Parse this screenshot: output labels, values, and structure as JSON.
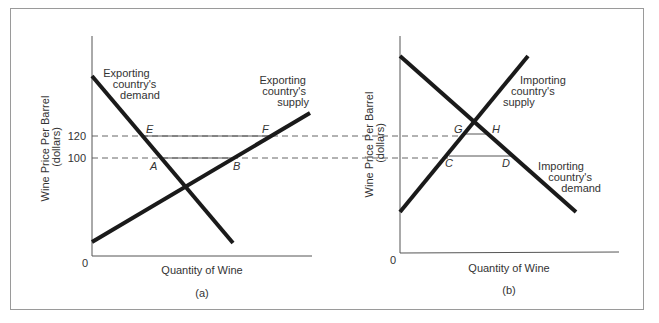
{
  "panels": [
    {
      "id": "a",
      "caption": "(a)",
      "y_axis_title_line1": "Wine Price Per Barrel",
      "y_axis_title_line2": "(dollars)",
      "x_axis_title": "Quantity of Wine",
      "origin_label": "0",
      "y_ticks": [
        "120",
        "100"
      ],
      "curves": {
        "demand": {
          "line1": "Exporting",
          "line2": "country's",
          "line3": "demand"
        },
        "supply": {
          "line1": "Exporting",
          "line2": "country's",
          "line3": "supply"
        }
      },
      "points": {
        "E": "E",
        "F": "F",
        "A": "A",
        "B": "B"
      }
    },
    {
      "id": "b",
      "caption": "(b)",
      "y_axis_title_line1": "Wine Price Per Barrel",
      "y_axis_title_line2": "(dollars)",
      "x_axis_title": "Quantity of Wine",
      "origin_label": "0",
      "curves": {
        "supply": {
          "line1": "Importing",
          "line2": "country's",
          "line3": "supply"
        },
        "demand": {
          "line1": "Importing",
          "line2": "country's",
          "line3": "demand"
        }
      },
      "points": {
        "G": "G",
        "H": "H",
        "C": "C",
        "D": "D"
      }
    }
  ],
  "price_levels": {
    "high": 120,
    "low": 100
  },
  "colors": {
    "curve": "#1a1a1a",
    "axis": "#555555",
    "dashed": "#555555",
    "frame": "#9a9a9a"
  }
}
